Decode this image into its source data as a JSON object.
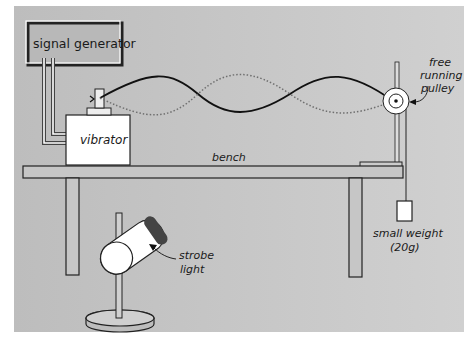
{
  "diagram": {
    "background_color": "#c4c4c4",
    "components": {
      "signal_generator": {
        "label": "signal generator"
      },
      "vibrator": {
        "label": "vibrator"
      },
      "bench": {
        "label": "bench"
      },
      "pulley": {
        "label_lines": [
          "free",
          "running",
          "pulley"
        ]
      },
      "weight": {
        "label_lines": [
          "small weight",
          "(20g)"
        ]
      },
      "strobe": {
        "label_lines": [
          "strobe",
          "light"
        ]
      }
    },
    "wave": {
      "solid_color": "#111111",
      "dotted_color": "#777777",
      "loops": 3
    }
  }
}
